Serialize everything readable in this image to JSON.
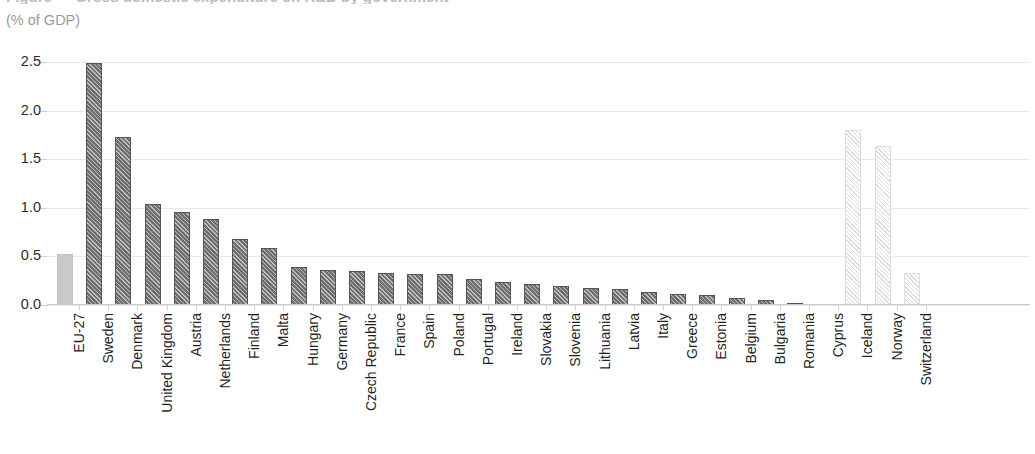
{
  "header": {
    "title": "Figure — Gross domestic expenditure on R&D by government",
    "subtitle": "(% of GDP)"
  },
  "chart_data": {
    "type": "bar",
    "title": "",
    "subtitle": "(% of GDP)",
    "xlabel": "",
    "ylabel": "(% of GDP)",
    "ylim": [
      0.0,
      2.5
    ],
    "yticks": [
      "0.0",
      "0.5",
      "1.0",
      "1.5",
      "2.0",
      "2.5"
    ],
    "ytick_values": [
      0.0,
      0.5,
      1.0,
      1.5,
      2.0,
      2.5
    ],
    "grid": true,
    "legend": "none",
    "categories": [
      "EU-27",
      "Sweden",
      "Denmark",
      "United Kingdom",
      "Austria",
      "Netherlands",
      "Finland",
      "Malta",
      "Hungary",
      "Germany",
      "Czech Republic",
      "France",
      "Spain",
      "Poland",
      "Portugal",
      "Ireland",
      "Slovakia",
      "Slovenia",
      "Lithuania",
      "Latvia",
      "Italy",
      "Greece",
      "Estonia",
      "Belgium",
      "Bulgaria",
      "Romania",
      "Cyprus",
      "Iceland",
      "Norway",
      "Switzerland"
    ],
    "values": [
      0.52,
      2.49,
      1.73,
      1.04,
      0.96,
      0.88,
      0.68,
      0.59,
      0.39,
      0.36,
      0.35,
      0.33,
      0.32,
      0.32,
      0.27,
      0.24,
      0.22,
      0.2,
      0.17,
      0.16,
      0.13,
      0.11,
      0.1,
      0.07,
      0.05,
      0.02,
      0.0,
      1.8,
      1.64,
      0.33
    ],
    "styles": [
      "solid-light",
      "dark",
      "dark",
      "dark",
      "dark",
      "dark",
      "dark",
      "dark",
      "dark",
      "dark",
      "dark",
      "dark",
      "dark",
      "dark",
      "dark",
      "dark",
      "dark",
      "dark",
      "dark",
      "dark",
      "dark",
      "dark",
      "dark",
      "dark",
      "dark",
      "dark",
      "dark",
      "light-hatch",
      "light-hatch",
      "light-hatch"
    ],
    "colors": {
      "aggregate": "#c9c9c9",
      "member_state": "#6e6e6e",
      "non_member": "#dcdcdc",
      "gridline": "#e9e9e9",
      "axis": "#c9c9c9",
      "text": "#1f1f1f",
      "subtitle": "#9a9a9a"
    }
  }
}
